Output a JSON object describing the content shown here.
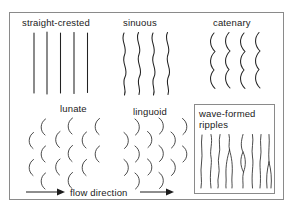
{
  "figure": {
    "background_color": "#ffffff",
    "frame_color": "#8a8a8a",
    "ink_color": "#222222",
    "panels": [
      {
        "id": "straight-crested",
        "label": "straight-crested",
        "pattern_type": "straight vertical crest lines",
        "crest_count": 5
      },
      {
        "id": "sinuous",
        "label": "sinuous",
        "pattern_type": "continuous smooth wavy vertical crest lines",
        "crest_count": 4
      },
      {
        "id": "catenary",
        "label": "catenary",
        "pattern_type": "linked catenary arcs forming cusped vertical chains",
        "crest_count": 4
      },
      {
        "id": "lunate",
        "label": "lunate",
        "pattern_type": "isolated crescent arcs concave downstream (opening right)",
        "crest_count": 14
      },
      {
        "id": "linguoid",
        "label": "linguoid",
        "pattern_type": "isolated tongue-shaped arcs convex downstream (opening left)",
        "crest_count": 14
      },
      {
        "id": "wave-formed-ripples",
        "label_line_1": "wave-formed",
        "label_line_2": "ripples",
        "pattern_type": "long straight to slightly sinuous crests with bifurcations (tuning-fork junctions)",
        "crest_count": 8,
        "boxed": true
      }
    ],
    "flow_direction": {
      "label": "flow direction",
      "arrow_left": "→",
      "arrow_right": "→",
      "direction": "left to right"
    }
  }
}
